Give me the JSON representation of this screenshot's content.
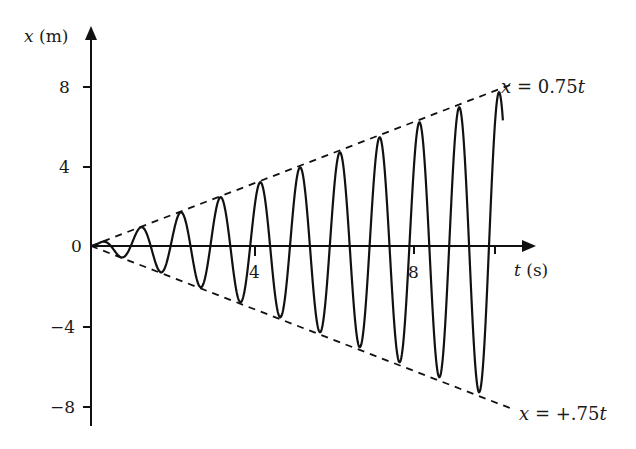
{
  "chart_data": {
    "type": "line",
    "title": "",
    "xlabel_var": "t",
    "xlabel_unit": "(s)",
    "ylabel_var": "x",
    "ylabel_unit": "(m)",
    "xlim": [
      0,
      11.1
    ],
    "ylim": [
      -8.5,
      10.8
    ],
    "x_ticks": [
      {
        "value": 4,
        "label": "4"
      },
      {
        "value": 8,
        "label": "8"
      },
      {
        "value": 10,
        "label": ""
      }
    ],
    "y_ticks": [
      {
        "value": 8,
        "label": "8"
      },
      {
        "value": 4,
        "label": "4"
      },
      {
        "value": 0,
        "label": "0"
      },
      {
        "value": -4,
        "label": "−4"
      },
      {
        "value": -8,
        "label": "−8"
      }
    ],
    "grid": false,
    "series": [
      {
        "name": "oscillation",
        "style": "solid",
        "formula": "x = 0.75 t sin(2πt)",
        "t_range": [
          0,
          10.35
        ],
        "amplitude_slope": 0.75,
        "frequency_hz": 1
      },
      {
        "name": "upper envelope",
        "style": "dashed",
        "formula": "x = 0.75t",
        "t_range": [
          0,
          10.3
        ]
      },
      {
        "name": "lower envelope",
        "style": "dashed",
        "formula": "x = −0.75t",
        "t_range": [
          0,
          10.3
        ]
      }
    ],
    "annotations": [
      {
        "text_var": "x",
        "text_rest": " = 0.75",
        "text_var2": "t",
        "position": "upper-right"
      },
      {
        "text_var": "x",
        "text_rest": " = +.75",
        "text_var2": "t",
        "position": "lower-right"
      }
    ]
  },
  "axes": {
    "y_var": "x",
    "y_unit": "(m)",
    "x_var": "t",
    "x_unit": "(s)"
  },
  "labels": {
    "upper_eq_var": "x",
    "upper_eq_mid": " = 0.75",
    "upper_eq_t": "t",
    "lower_eq_var": "x",
    "lower_eq_mid": " = +.75",
    "lower_eq_t": "t"
  },
  "ticks": {
    "y8": "8",
    "y4": "4",
    "y0": "0",
    "ym4": "−4",
    "ym8": "−8",
    "x4": "4",
    "x8": "8"
  }
}
